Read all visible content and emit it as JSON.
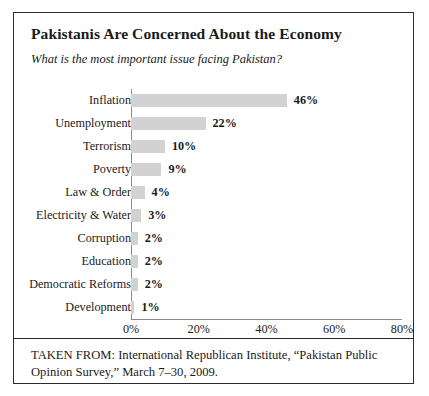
{
  "figure": {
    "title": "Pakistanis Are Concerned About the Economy",
    "subtitle": "What is the most important issue facing Pakistan?",
    "source": "TAKEN FROM: International Republican Institute, “Pakistan Public Opinion Survey,” March 7–30, 2009."
  },
  "colors": {
    "bar_fill": "#d2d2d2",
    "border": "#2b2b2b",
    "axis": "#8a8a8a",
    "text": "#1a1a1a"
  },
  "chart_data": {
    "type": "bar",
    "orientation": "horizontal",
    "title": "Pakistanis Are Concerned About the Economy",
    "subtitle": "What is the most important issue facing Pakistan?",
    "xlabel": "",
    "ylabel": "",
    "xlim": [
      0,
      80
    ],
    "grid": false,
    "legend": null,
    "xticks": [
      0,
      20,
      40,
      60,
      80
    ],
    "xtick_labels": [
      "0%",
      "20%",
      "40%",
      "60%",
      "80%"
    ],
    "categories": [
      "Inflation",
      "Unemployment",
      "Terrorism",
      "Poverty",
      "Law & Order",
      "Electricity & Water",
      "Corruption",
      "Education",
      "Democratic Reforms",
      "Development"
    ],
    "values": [
      46,
      22,
      10,
      9,
      4,
      3,
      2,
      2,
      2,
      1
    ],
    "data_labels": [
      "46%",
      "22%",
      "10%",
      "9%",
      "4%",
      "3%",
      "2%",
      "2%",
      "2%",
      "1%"
    ]
  }
}
